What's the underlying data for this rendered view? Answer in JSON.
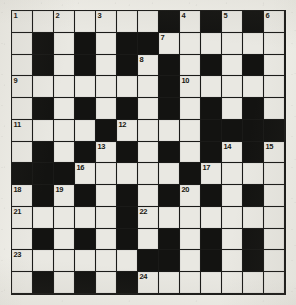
{
  "puzzle": {
    "type": "crossword-grid",
    "columns": 13,
    "rows": 13,
    "colors": {
      "paper": "#f0efe9",
      "white_cell": "#e9e8e2",
      "black_cell": "#131311",
      "grid_line": "#1a1a18",
      "number_text": "#17160f"
    },
    "clue_numbers": [
      1,
      2,
      3,
      4,
      5,
      6,
      7,
      8,
      9,
      10,
      11,
      12,
      13,
      14,
      15,
      16,
      17,
      18,
      19,
      20,
      21,
      22,
      23,
      24
    ],
    "grid": [
      [
        {
          "state": "white",
          "number": "1"
        },
        {
          "state": "white",
          "number": ""
        },
        {
          "state": "white",
          "number": "2"
        },
        {
          "state": "white",
          "number": ""
        },
        {
          "state": "white",
          "number": "3"
        },
        {
          "state": "white",
          "number": ""
        },
        {
          "state": "white",
          "number": ""
        },
        {
          "state": "black",
          "number": ""
        },
        {
          "state": "white",
          "number": "4"
        },
        {
          "state": "black",
          "number": ""
        },
        {
          "state": "white",
          "number": "5"
        },
        {
          "state": "black",
          "number": ""
        },
        {
          "state": "white",
          "number": "6"
        }
      ],
      [
        {
          "state": "white",
          "number": ""
        },
        {
          "state": "black",
          "number": ""
        },
        {
          "state": "white",
          "number": ""
        },
        {
          "state": "black",
          "number": ""
        },
        {
          "state": "white",
          "number": ""
        },
        {
          "state": "black",
          "number": ""
        },
        {
          "state": "black",
          "number": ""
        },
        {
          "state": "white",
          "number": "7"
        },
        {
          "state": "white",
          "number": ""
        },
        {
          "state": "white",
          "number": ""
        },
        {
          "state": "white",
          "number": ""
        },
        {
          "state": "white",
          "number": ""
        },
        {
          "state": "white",
          "number": ""
        }
      ],
      [
        {
          "state": "white",
          "number": ""
        },
        {
          "state": "black",
          "number": ""
        },
        {
          "state": "white",
          "number": ""
        },
        {
          "state": "black",
          "number": ""
        },
        {
          "state": "white",
          "number": ""
        },
        {
          "state": "black",
          "number": ""
        },
        {
          "state": "white",
          "number": "8"
        },
        {
          "state": "black",
          "number": ""
        },
        {
          "state": "white",
          "number": ""
        },
        {
          "state": "black",
          "number": ""
        },
        {
          "state": "white",
          "number": ""
        },
        {
          "state": "black",
          "number": ""
        },
        {
          "state": "white",
          "number": ""
        }
      ],
      [
        {
          "state": "white",
          "number": "9"
        },
        {
          "state": "white",
          "number": ""
        },
        {
          "state": "white",
          "number": ""
        },
        {
          "state": "white",
          "number": ""
        },
        {
          "state": "white",
          "number": ""
        },
        {
          "state": "white",
          "number": ""
        },
        {
          "state": "white",
          "number": ""
        },
        {
          "state": "black",
          "number": ""
        },
        {
          "state": "white",
          "number": "10"
        },
        {
          "state": "white",
          "number": ""
        },
        {
          "state": "white",
          "number": ""
        },
        {
          "state": "white",
          "number": ""
        },
        {
          "state": "white",
          "number": ""
        }
      ],
      [
        {
          "state": "white",
          "number": ""
        },
        {
          "state": "black",
          "number": ""
        },
        {
          "state": "white",
          "number": ""
        },
        {
          "state": "black",
          "number": ""
        },
        {
          "state": "white",
          "number": ""
        },
        {
          "state": "black",
          "number": ""
        },
        {
          "state": "white",
          "number": ""
        },
        {
          "state": "black",
          "number": ""
        },
        {
          "state": "white",
          "number": ""
        },
        {
          "state": "black",
          "number": ""
        },
        {
          "state": "white",
          "number": ""
        },
        {
          "state": "black",
          "number": ""
        },
        {
          "state": "white",
          "number": ""
        }
      ],
      [
        {
          "state": "white",
          "number": "11"
        },
        {
          "state": "white",
          "number": ""
        },
        {
          "state": "white",
          "number": ""
        },
        {
          "state": "white",
          "number": ""
        },
        {
          "state": "black",
          "number": ""
        },
        {
          "state": "white",
          "number": "12"
        },
        {
          "state": "white",
          "number": ""
        },
        {
          "state": "white",
          "number": ""
        },
        {
          "state": "white",
          "number": ""
        },
        {
          "state": "black",
          "number": ""
        },
        {
          "state": "black",
          "number": ""
        },
        {
          "state": "black",
          "number": ""
        },
        {
          "state": "black",
          "number": ""
        }
      ],
      [
        {
          "state": "white",
          "number": ""
        },
        {
          "state": "black",
          "number": ""
        },
        {
          "state": "white",
          "number": ""
        },
        {
          "state": "black",
          "number": ""
        },
        {
          "state": "white",
          "number": "13"
        },
        {
          "state": "black",
          "number": ""
        },
        {
          "state": "white",
          "number": ""
        },
        {
          "state": "black",
          "number": ""
        },
        {
          "state": "white",
          "number": ""
        },
        {
          "state": "black",
          "number": ""
        },
        {
          "state": "white",
          "number": "14"
        },
        {
          "state": "black",
          "number": ""
        },
        {
          "state": "white",
          "number": "15"
        }
      ],
      [
        {
          "state": "black",
          "number": ""
        },
        {
          "state": "black",
          "number": ""
        },
        {
          "state": "black",
          "number": ""
        },
        {
          "state": "white",
          "number": "16"
        },
        {
          "state": "white",
          "number": ""
        },
        {
          "state": "white",
          "number": ""
        },
        {
          "state": "white",
          "number": ""
        },
        {
          "state": "white",
          "number": ""
        },
        {
          "state": "black",
          "number": ""
        },
        {
          "state": "white",
          "number": "17"
        },
        {
          "state": "white",
          "number": ""
        },
        {
          "state": "white",
          "number": ""
        },
        {
          "state": "white",
          "number": ""
        }
      ],
      [
        {
          "state": "white",
          "number": "18"
        },
        {
          "state": "black",
          "number": ""
        },
        {
          "state": "white",
          "number": "19"
        },
        {
          "state": "black",
          "number": ""
        },
        {
          "state": "white",
          "number": ""
        },
        {
          "state": "black",
          "number": ""
        },
        {
          "state": "white",
          "number": ""
        },
        {
          "state": "black",
          "number": ""
        },
        {
          "state": "white",
          "number": "20"
        },
        {
          "state": "black",
          "number": ""
        },
        {
          "state": "white",
          "number": ""
        },
        {
          "state": "black",
          "number": ""
        },
        {
          "state": "white",
          "number": ""
        }
      ],
      [
        {
          "state": "white",
          "number": "21"
        },
        {
          "state": "white",
          "number": ""
        },
        {
          "state": "white",
          "number": ""
        },
        {
          "state": "white",
          "number": ""
        },
        {
          "state": "white",
          "number": ""
        },
        {
          "state": "black",
          "number": ""
        },
        {
          "state": "white",
          "number": "22"
        },
        {
          "state": "white",
          "number": ""
        },
        {
          "state": "white",
          "number": ""
        },
        {
          "state": "white",
          "number": ""
        },
        {
          "state": "white",
          "number": ""
        },
        {
          "state": "white",
          "number": ""
        },
        {
          "state": "white",
          "number": ""
        }
      ],
      [
        {
          "state": "white",
          "number": ""
        },
        {
          "state": "black",
          "number": ""
        },
        {
          "state": "white",
          "number": ""
        },
        {
          "state": "black",
          "number": ""
        },
        {
          "state": "white",
          "number": ""
        },
        {
          "state": "black",
          "number": ""
        },
        {
          "state": "white",
          "number": ""
        },
        {
          "state": "black",
          "number": ""
        },
        {
          "state": "white",
          "number": ""
        },
        {
          "state": "black",
          "number": ""
        },
        {
          "state": "white",
          "number": ""
        },
        {
          "state": "black",
          "number": ""
        },
        {
          "state": "white",
          "number": ""
        }
      ],
      [
        {
          "state": "white",
          "number": "23"
        },
        {
          "state": "white",
          "number": ""
        },
        {
          "state": "white",
          "number": ""
        },
        {
          "state": "white",
          "number": ""
        },
        {
          "state": "white",
          "number": ""
        },
        {
          "state": "white",
          "number": ""
        },
        {
          "state": "black",
          "number": ""
        },
        {
          "state": "black",
          "number": ""
        },
        {
          "state": "white",
          "number": ""
        },
        {
          "state": "black",
          "number": ""
        },
        {
          "state": "white",
          "number": ""
        },
        {
          "state": "black",
          "number": ""
        },
        {
          "state": "white",
          "number": ""
        }
      ],
      [
        {
          "state": "white",
          "number": ""
        },
        {
          "state": "black",
          "number": ""
        },
        {
          "state": "white",
          "number": ""
        },
        {
          "state": "black",
          "number": ""
        },
        {
          "state": "white",
          "number": ""
        },
        {
          "state": "black",
          "number": ""
        },
        {
          "state": "white",
          "number": "24"
        },
        {
          "state": "white",
          "number": ""
        },
        {
          "state": "white",
          "number": ""
        },
        {
          "state": "white",
          "number": ""
        },
        {
          "state": "white",
          "number": ""
        },
        {
          "state": "white",
          "number": ""
        },
        {
          "state": "white",
          "number": ""
        }
      ]
    ]
  }
}
